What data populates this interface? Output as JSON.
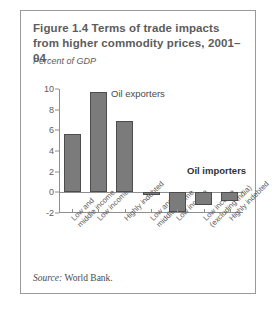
{
  "figure": {
    "title": "Figure 1.4  Terms of trade impacts from higher commodity prices, 2001–04",
    "source_prefix": "Source:",
    "source_text": "World Bank."
  },
  "chart_data": {
    "type": "bar",
    "title": "Figure 1.4  Terms of trade impacts from higher commodity prices, 2001–04",
    "ylabel": "Percent of GDP",
    "xlabel": "",
    "ylim": [
      -2,
      10
    ],
    "yticks": [
      10,
      8,
      6,
      4,
      2,
      0,
      -2
    ],
    "ytick_labels": [
      "10",
      "8",
      "6",
      "4",
      "2",
      "0",
      "-2"
    ],
    "grid": false,
    "legend": "none",
    "bar_color": "#7b7b7b",
    "bar_edge_color": "#4d4d4d",
    "categories": [
      "Low and\nmiddle income",
      "Low income",
      "Highly indebted",
      "Low and\nmiddle income",
      "Low income",
      "Low income\n(excluding India)",
      "Highly indebted"
    ],
    "values": [
      5.6,
      9.7,
      6.9,
      -0.25,
      -1.9,
      -1.2,
      -0.85
    ],
    "annotations": [
      {
        "text": "Oil exporters",
        "bold": false
      },
      {
        "text": "Oil importers",
        "bold": true
      }
    ]
  }
}
